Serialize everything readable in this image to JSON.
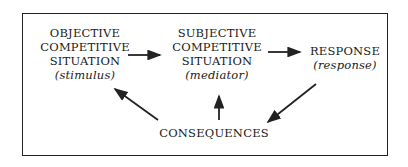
{
  "nodes": {
    "objective": {
      "lines": [
        "OBJECTIVE",
        "COMPETITIVE",
        "SITUATION"
      ],
      "role": "(stimulus)"
    },
    "subjective": {
      "lines": [
        "SUBJECTIVE",
        "COMPETITIVE",
        "SITUATION"
      ],
      "role": "(mediator)"
    },
    "response": {
      "lines": [
        "RESPONSE"
      ],
      "role": "(response)"
    },
    "consequences": {
      "lines": [
        "CONSEQUENCES"
      ]
    }
  },
  "edges": [
    {
      "from": "objective",
      "to": "subjective"
    },
    {
      "from": "subjective",
      "to": "response"
    },
    {
      "from": "response",
      "to": "consequences"
    },
    {
      "from": "consequences",
      "to": "objective"
    },
    {
      "from": "consequences",
      "to": "subjective"
    }
  ]
}
